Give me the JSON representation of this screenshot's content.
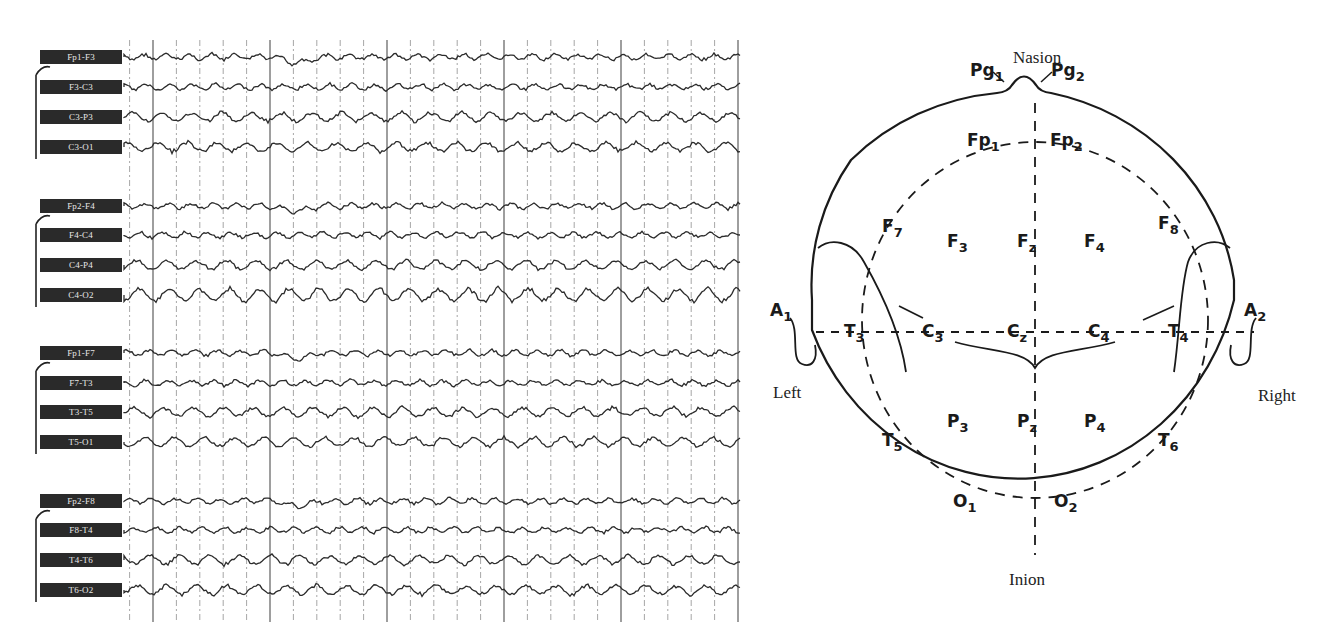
{
  "eeg": {
    "channel_groups": [
      {
        "name": "left-parasagittal",
        "channels": [
          {
            "label": "Fp1-F3",
            "y": 57
          },
          {
            "label": "F3-C3",
            "y": 87
          },
          {
            "label": "C3-P3",
            "y": 117
          },
          {
            "label": "C3-O1",
            "y": 147
          }
        ]
      },
      {
        "name": "right-parasagittal",
        "channels": [
          {
            "label": "Fp2-F4",
            "y": 206
          },
          {
            "label": "F4-C4",
            "y": 235
          },
          {
            "label": "C4-P4",
            "y": 265
          },
          {
            "label": "C4-O2",
            "y": 295
          }
        ]
      },
      {
        "name": "left-temporal",
        "channels": [
          {
            "label": "Fp1-F7",
            "y": 353
          },
          {
            "label": "F7-T3",
            "y": 383
          },
          {
            "label": "T3-T5",
            "y": 412
          },
          {
            "label": "T5-O1",
            "y": 442
          }
        ]
      },
      {
        "name": "right-temporal",
        "channels": [
          {
            "label": "Fp2-F8",
            "y": 501
          },
          {
            "label": "F8-T4",
            "y": 530
          },
          {
            "label": "T4-T6",
            "y": 560
          },
          {
            "label": "T6-O2",
            "y": 590
          }
        ]
      }
    ],
    "trace_x_start": 124,
    "trace_x_end": 740,
    "grid_spacing": 23.4,
    "grid_major_every": 5,
    "grid_top": 40,
    "grid_bottom": 622,
    "trace_color": "#2b2b2b",
    "grid_color": "#6a6a6a"
  },
  "head_map": {
    "title_top": "Nasion",
    "title_bottom": "Inion",
    "side_left": "Left",
    "side_right": "Right",
    "electrodes": [
      {
        "id": "Pg1",
        "base": "Pg",
        "sub": "1",
        "x": 210,
        "y": 62
      },
      {
        "id": "Pg2",
        "base": "Pg",
        "sub": "2",
        "x": 291,
        "y": 62
      },
      {
        "id": "Fp1",
        "base": "Fp",
        "sub": "1",
        "x": 207,
        "y": 132
      },
      {
        "id": "Fp2",
        "base": "Fp",
        "sub": "2",
        "x": 290,
        "y": 132
      },
      {
        "id": "F7",
        "base": "F",
        "sub": "7",
        "x": 122,
        "y": 218
      },
      {
        "id": "F3",
        "base": "F",
        "sub": "3",
        "x": 187,
        "y": 233
      },
      {
        "id": "Fz",
        "base": "F",
        "sub": "z",
        "x": 257,
        "y": 233
      },
      {
        "id": "F4",
        "base": "F",
        "sub": "4",
        "x": 324,
        "y": 233
      },
      {
        "id": "F8",
        "base": "F",
        "sub": "8",
        "x": 398,
        "y": 215
      },
      {
        "id": "A1",
        "base": "A",
        "sub": "1",
        "x": 10,
        "y": 302
      },
      {
        "id": "T3",
        "base": "T",
        "sub": "3",
        "x": 84,
        "y": 323
      },
      {
        "id": "C3",
        "base": "C",
        "sub": "3",
        "x": 162,
        "y": 323
      },
      {
        "id": "Cz",
        "base": "C",
        "sub": "z",
        "x": 247,
        "y": 323
      },
      {
        "id": "C4",
        "base": "C",
        "sub": "4",
        "x": 328,
        "y": 323
      },
      {
        "id": "T4",
        "base": "T",
        "sub": "4",
        "x": 408,
        "y": 323
      },
      {
        "id": "A2",
        "base": "A",
        "sub": "2",
        "x": 484,
        "y": 302
      },
      {
        "id": "T5",
        "base": "T",
        "sub": "5",
        "x": 122,
        "y": 432
      },
      {
        "id": "P3",
        "base": "P",
        "sub": "3",
        "x": 187,
        "y": 413
      },
      {
        "id": "Pz",
        "base": "P",
        "sub": "z",
        "x": 257,
        "y": 413
      },
      {
        "id": "P4",
        "base": "P",
        "sub": "4",
        "x": 324,
        "y": 413
      },
      {
        "id": "T6",
        "base": "T",
        "sub": "6",
        "x": 398,
        "y": 432
      },
      {
        "id": "O1",
        "base": "O",
        "sub": "1",
        "x": 193,
        "y": 493
      },
      {
        "id": "O2",
        "base": "O",
        "sub": "2",
        "x": 294,
        "y": 493
      }
    ]
  }
}
